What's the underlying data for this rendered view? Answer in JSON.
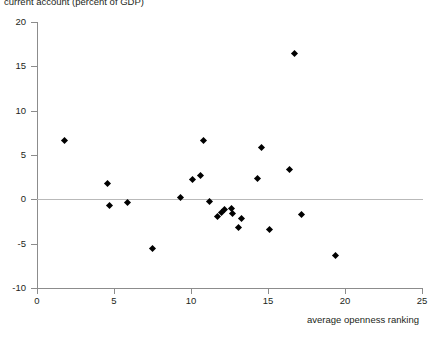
{
  "chart_data": {
    "type": "scatter",
    "title": "current account (percent of GDP)",
    "xlabel": "average openness ranking",
    "ylabel": "current account (percent of GDP)",
    "xlim": [
      0,
      25
    ],
    "ylim": [
      -10,
      20
    ],
    "xticks": [
      0,
      5,
      10,
      15,
      20,
      25
    ],
    "yticks": [
      -10,
      -5,
      0,
      5,
      10,
      15,
      20
    ],
    "grid": false,
    "legend": null,
    "marker": "filled-diamond",
    "marker_color": "#000000",
    "zero_reference_line": true,
    "points": [
      {
        "x": 1.8,
        "y": 6.6
      },
      {
        "x": 4.6,
        "y": 1.8
      },
      {
        "x": 4.7,
        "y": -0.7
      },
      {
        "x": 5.9,
        "y": -0.35
      },
      {
        "x": 7.5,
        "y": -5.5
      },
      {
        "x": 9.3,
        "y": 0.2
      },
      {
        "x": 10.1,
        "y": 2.2
      },
      {
        "x": 10.6,
        "y": 2.7
      },
      {
        "x": 10.8,
        "y": 6.6
      },
      {
        "x": 11.2,
        "y": -0.3
      },
      {
        "x": 11.7,
        "y": -1.9
      },
      {
        "x": 12.0,
        "y": -1.5
      },
      {
        "x": 12.2,
        "y": -1.2
      },
      {
        "x": 12.6,
        "y": -1.0
      },
      {
        "x": 12.7,
        "y": -1.6
      },
      {
        "x": 13.1,
        "y": -3.2
      },
      {
        "x": 13.3,
        "y": -2.2
      },
      {
        "x": 14.3,
        "y": 2.3
      },
      {
        "x": 14.6,
        "y": 5.9
      },
      {
        "x": 15.1,
        "y": -3.4
      },
      {
        "x": 16.4,
        "y": 3.4
      },
      {
        "x": 16.7,
        "y": 16.5
      },
      {
        "x": 17.2,
        "y": -1.7
      },
      {
        "x": 19.4,
        "y": -6.3
      }
    ]
  },
  "axes": {
    "y_tick_labels": [
      "20",
      "15",
      "10",
      "5",
      "0",
      "-5",
      "-10"
    ],
    "x_tick_labels": [
      "0",
      "5",
      "10",
      "15",
      "20",
      "25"
    ]
  }
}
